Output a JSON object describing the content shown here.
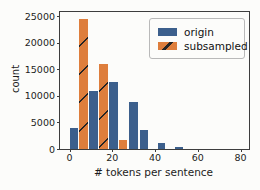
{
  "chart_data": {
    "type": "bar",
    "title": "",
    "xlabel": "# tokens per sentence",
    "ylabel": "count",
    "xlim": [
      -4.5,
      84
    ],
    "ylim": [
      0,
      25800
    ],
    "x_ticks": [
      0,
      20,
      40,
      60,
      80
    ],
    "y_ticks": [
      0,
      5000,
      10000,
      15000,
      20000,
      25000
    ],
    "grid": false,
    "legend_position": "upper right",
    "colors": {
      "origin": "#3c5f8c",
      "subsampled": "#de7e3c",
      "hatch": "#252525"
    },
    "series": [
      {
        "name": "origin",
        "color": "#3c5f8c",
        "hatch": false,
        "bars": [
          {
            "x0": 0.2,
            "x1": 4.0,
            "count": 4000
          },
          {
            "x0": 9.0,
            "x1": 13.1,
            "count": 11000
          },
          {
            "x0": 18.4,
            "x1": 22.8,
            "count": 12700
          },
          {
            "x0": 27.7,
            "x1": 31.8,
            "count": 8900
          },
          {
            "x0": 32.9,
            "x1": 36.8,
            "count": 3600
          },
          {
            "x0": 41.2,
            "x1": 44.6,
            "count": 1200
          },
          {
            "x0": 49.3,
            "x1": 52.9,
            "count": 300
          }
        ]
      },
      {
        "name": "subsampled",
        "color": "#de7e3c",
        "hatch": true,
        "bars": [
          {
            "x0": 4.3,
            "x1": 8.4,
            "count": 24400
          },
          {
            "x0": 13.7,
            "x1": 17.8,
            "count": 16100
          },
          {
            "x0": 23.1,
            "x1": 27.0,
            "count": 1700
          }
        ]
      }
    ]
  }
}
